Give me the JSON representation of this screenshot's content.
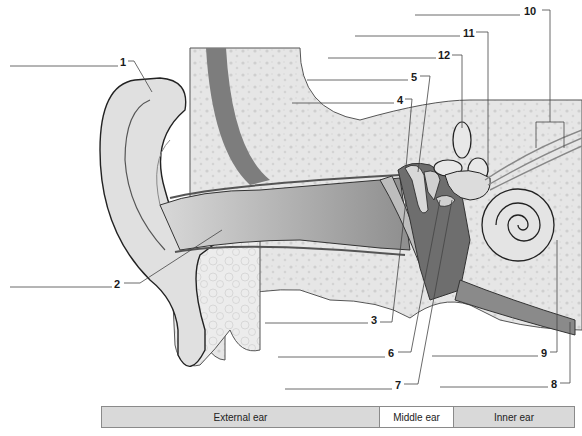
{
  "diagram": {
    "type": "anatomy-diagram",
    "labels": [
      {
        "id": "1",
        "text": "1"
      },
      {
        "id": "2",
        "text": "2"
      },
      {
        "id": "3",
        "text": "3"
      },
      {
        "id": "4",
        "text": "4"
      },
      {
        "id": "5",
        "text": "5"
      },
      {
        "id": "6",
        "text": "6"
      },
      {
        "id": "7",
        "text": "7"
      },
      {
        "id": "8",
        "text": "8"
      },
      {
        "id": "9",
        "text": "9"
      },
      {
        "id": "10",
        "text": "10"
      },
      {
        "id": "11",
        "text": "11"
      },
      {
        "id": "12",
        "text": "12"
      }
    ],
    "legend": {
      "external": "External ear",
      "middle": "Middle ear",
      "inner": "Inner ear"
    },
    "colors": {
      "bone": "#e4e4e4",
      "canal": "#9a9a9a",
      "dark_tissue": "#6e6e6e",
      "skin": "#d0d0d0",
      "outline": "#2a2a2a"
    }
  }
}
